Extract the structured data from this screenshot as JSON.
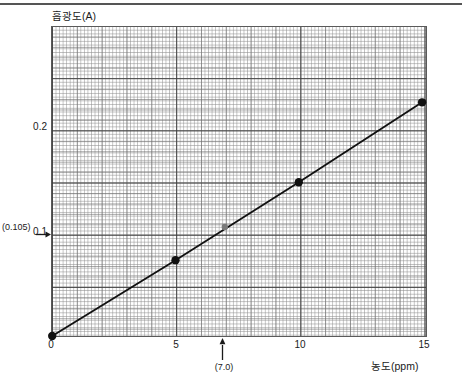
{
  "figure": {
    "top_rule": "horizontal-rule",
    "y_axis_title": "흡광도(A)",
    "x_axis_title": "농도(ppm)"
  },
  "annotations": {
    "y_readout": "(0.105)",
    "x_readout": "(7.0)",
    "y_arrow_icon": "arrow-right-icon",
    "x_arrow_icon": "arrow-up-icon"
  },
  "chart_data": {
    "type": "line",
    "title": "",
    "subtitle": "",
    "xlabel": "농도(ppm)",
    "ylabel": "흡광도(A)",
    "xlim": [
      0,
      15.15
    ],
    "ylim": [
      0,
      0.2975
    ],
    "grid": true,
    "legend": "none",
    "x_ticks": [
      "0",
      "5",
      "10",
      "15"
    ],
    "x_tick_values": [
      0,
      5,
      10,
      15
    ],
    "y_ticks": [
      "0.1",
      "0.2"
    ],
    "y_tick_values": [
      0.1,
      0.2
    ],
    "series": [
      {
        "name": "calibration-curve",
        "marker": "filled-circle",
        "color": "#111111",
        "x": [
          0,
          5,
          10,
          15
        ],
        "values": [
          0.0,
          0.073,
          0.148,
          0.225
        ]
      }
    ],
    "interpolated_point": {
      "label": "sample",
      "x": 7.0,
      "y": 0.105,
      "x_text": "(7.0)",
      "y_text": "(0.105)",
      "color": "#7a7a7a"
    }
  }
}
